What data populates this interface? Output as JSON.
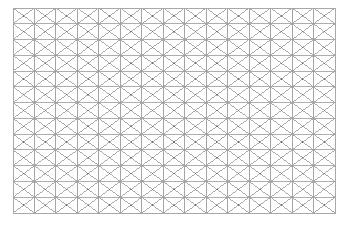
{
  "figure": {
    "name": "triangular-mesh-grid",
    "kind": "lattice-diagram",
    "background_color": "#ffffff",
    "caption": "",
    "title": "",
    "labels": []
  },
  "canvas": {
    "width": 348,
    "height": 225
  },
  "grid": {
    "origin_x": 13,
    "origin_y": 8,
    "width": 322,
    "height": 205,
    "columns": 15,
    "rows": 13,
    "cell_width": 21.4667,
    "cell_height": 15.769,
    "border_color": "#a8a8a8",
    "border_width": 1.0,
    "vertical_line_color": "#9b9b9b",
    "vertical_line_width": 0.9,
    "horizontal_line_color": "#a0a0a0",
    "horizontal_line_width": 0.85,
    "diagonal_line_color": "#8f8f8f",
    "diagonal_line_width": 0.75,
    "node_color": "#707070",
    "node_radius": 0.7,
    "pattern": "rectangular-cells-with-both-diagonals"
  },
  "chart_data": {
    "type": "table",
    "title": "",
    "xlabel": "",
    "ylabel": "",
    "categories": [],
    "values": [],
    "grid": true,
    "legend": "none"
  }
}
